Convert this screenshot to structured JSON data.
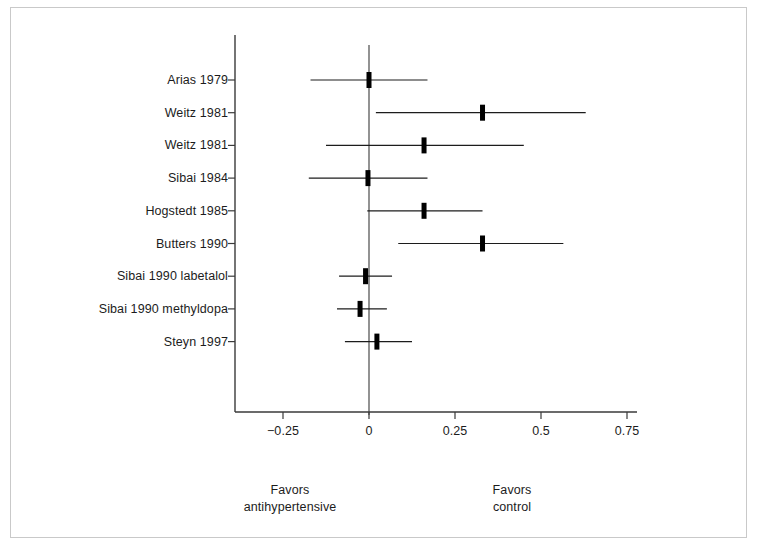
{
  "chart_data": {
    "type": "forest",
    "title": "",
    "xlabel": "",
    "ylabel": "",
    "xlim": [
      -0.39,
      0.78
    ],
    "xticks": [
      -0.25,
      0,
      0.25,
      0.5,
      0.75
    ],
    "xtick_labels": [
      "−0.25",
      "0",
      "0.25",
      "0.5",
      "0.75"
    ],
    "grid": false,
    "reference_line": 0,
    "legend": "none",
    "categories": [
      "Arias 1979",
      "Weitz 1981",
      "Weitz 1981",
      "Sibai 1984",
      "Hogstedt 1985",
      "Butters 1990",
      "Sibai 1990 labetalol",
      "Sibai 1990 methyldopa",
      "Steyn 1997"
    ],
    "points": [
      {
        "study": "Arias 1979",
        "estimate": 0.0,
        "ci_low": -0.17,
        "ci_high": 0.17
      },
      {
        "study": "Weitz 1981",
        "estimate": 0.33,
        "ci_low": 0.02,
        "ci_high": 0.63
      },
      {
        "study": "Weitz 1981",
        "estimate": 0.16,
        "ci_low": -0.125,
        "ci_high": 0.45
      },
      {
        "study": "Sibai 1984",
        "estimate": -0.003,
        "ci_low": -0.175,
        "ci_high": 0.17
      },
      {
        "study": "Hogstedt 1985",
        "estimate": 0.16,
        "ci_low": -0.005,
        "ci_high": 0.33
      },
      {
        "study": "Butters 1990",
        "estimate": 0.33,
        "ci_low": 0.085,
        "ci_high": 0.565
      },
      {
        "study": "Sibai 1990 labetalol",
        "estimate": -0.01,
        "ci_low": -0.087,
        "ci_high": 0.067
      },
      {
        "study": "Sibai 1990 methyldopa",
        "estimate": -0.026,
        "ci_low": -0.093,
        "ci_high": 0.052
      },
      {
        "study": "Steyn 1997",
        "estimate": 0.023,
        "ci_low": -0.07,
        "ci_high": 0.125
      }
    ],
    "annotations": {
      "left_favors_line1": "Favors",
      "left_favors_line2": "antihypertensive",
      "right_favors_line1": "Favors",
      "right_favors_line2": "control"
    },
    "colors": {
      "line": "#1c1c1c",
      "marker": "#000000",
      "axis": "#3a3a3a",
      "frame": "#c9c9c9",
      "background": "#ffffff"
    }
  },
  "geometry": {
    "x_zero_px": 369,
    "px_per_unit": 344,
    "row_top_px": 80,
    "row_step_px": 32.7,
    "axis_y_px": 412,
    "axis_left_px": 235,
    "axis_right_px": 637,
    "spine_top_px": 35,
    "zero_line_top_px": 45,
    "zero_line_bottom_px": 415,
    "label_right_px": 228,
    "tick_len_px": 7,
    "marker_width_px": 5,
    "marker_height_px": 16,
    "tick_label_y_px": 424,
    "foot_label_y_px": 482,
    "foot_left_x_px": 290,
    "foot_right_x_px": 512
  }
}
